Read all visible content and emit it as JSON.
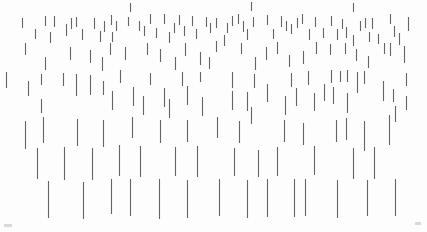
{
  "canvas": {
    "width": 427,
    "height": 232,
    "background": "#fdfdfd"
  },
  "pattern": {
    "stroke_color": "#4a4a4a",
    "stroke_width": 1.1,
    "stroke_opacity": 0.85,
    "faint_mark_color": "#d9d9d9",
    "segments": [
      [
        130,
        3,
        9
      ],
      [
        251,
        2,
        9
      ],
      [
        353,
        3,
        9
      ],
      [
        22,
        18,
        10
      ],
      [
        45,
        16,
        10
      ],
      [
        54,
        16,
        11
      ],
      [
        35,
        29,
        10
      ],
      [
        50,
        32,
        11
      ],
      [
        66,
        24,
        12
      ],
      [
        71,
        18,
        11
      ],
      [
        76,
        17,
        10
      ],
      [
        82,
        29,
        11
      ],
      [
        94,
        18,
        11
      ],
      [
        100,
        31,
        11
      ],
      [
        104,
        21,
        11
      ],
      [
        111,
        15,
        10
      ],
      [
        116,
        21,
        10
      ],
      [
        112,
        32,
        10
      ],
      [
        128,
        17,
        9
      ],
      [
        139,
        21,
        10
      ],
      [
        144,
        26,
        10
      ],
      [
        150,
        14,
        10
      ],
      [
        156,
        28,
        10
      ],
      [
        164,
        14,
        10
      ],
      [
        169,
        32,
        11
      ],
      [
        174,
        23,
        10
      ],
      [
        179,
        15,
        10
      ],
      [
        184,
        26,
        10
      ],
      [
        192,
        16,
        10
      ],
      [
        196,
        29,
        10
      ],
      [
        206,
        17,
        10
      ],
      [
        210,
        23,
        10
      ],
      [
        216,
        18,
        10
      ],
      [
        227,
        23,
        10
      ],
      [
        232,
        16,
        10
      ],
      [
        238,
        14,
        10
      ],
      [
        243,
        21,
        11
      ],
      [
        247,
        29,
        11
      ],
      [
        253,
        17,
        10
      ],
      [
        267,
        15,
        10
      ],
      [
        273,
        29,
        10
      ],
      [
        281,
        16,
        11
      ],
      [
        286,
        21,
        10
      ],
      [
        291,
        24,
        10
      ],
      [
        297,
        18,
        10
      ],
      [
        302,
        14,
        10
      ],
      [
        309,
        29,
        11
      ],
      [
        315,
        17,
        10
      ],
      [
        323,
        28,
        10
      ],
      [
        331,
        16,
        10
      ],
      [
        337,
        29,
        11
      ],
      [
        342,
        19,
        10
      ],
      [
        346,
        27,
        11
      ],
      [
        353,
        35,
        11
      ],
      [
        360,
        21,
        10
      ],
      [
        365,
        18,
        10
      ],
      [
        369,
        32,
        10
      ],
      [
        372,
        18,
        11
      ],
      [
        378,
        34,
        10
      ],
      [
        390,
        14,
        10
      ],
      [
        394,
        26,
        11
      ],
      [
        399,
        33,
        12
      ],
      [
        408,
        17,
        14
      ],
      [
        25,
        43,
        12
      ],
      [
        45,
        57,
        13
      ],
      [
        70,
        47,
        13
      ],
      [
        90,
        50,
        13
      ],
      [
        102,
        57,
        14
      ],
      [
        110,
        43,
        12
      ],
      [
        125,
        47,
        13
      ],
      [
        147,
        43,
        12
      ],
      [
        160,
        49,
        13
      ],
      [
        175,
        57,
        13
      ],
      [
        185,
        43,
        13
      ],
      [
        200,
        52,
        13
      ],
      [
        209,
        57,
        12
      ],
      [
        216,
        41,
        11
      ],
      [
        224,
        35,
        11
      ],
      [
        241,
        43,
        11
      ],
      [
        255,
        57,
        13
      ],
      [
        266,
        47,
        13
      ],
      [
        277,
        42,
        12
      ],
      [
        289,
        55,
        12
      ],
      [
        303,
        51,
        13
      ],
      [
        316,
        42,
        12
      ],
      [
        330,
        44,
        11
      ],
      [
        345,
        43,
        11
      ],
      [
        356,
        49,
        12
      ],
      [
        368,
        56,
        12
      ],
      [
        384,
        43,
        11
      ],
      [
        390,
        43,
        13
      ],
      [
        404,
        46,
        17
      ],
      [
        6,
        72,
        16
      ],
      [
        41,
        74,
        11
      ],
      [
        28,
        81,
        15
      ],
      [
        63,
        73,
        13
      ],
      [
        76,
        74,
        22
      ],
      [
        90,
        75,
        20
      ],
      [
        103,
        81,
        14
      ],
      [
        120,
        70,
        13
      ],
      [
        150,
        73,
        12
      ],
      [
        182,
        72,
        14
      ],
      [
        200,
        72,
        10
      ],
      [
        112,
        91,
        19
      ],
      [
        133,
        87,
        19
      ],
      [
        143,
        96,
        19
      ],
      [
        164,
        88,
        19
      ],
      [
        169,
        99,
        19
      ],
      [
        187,
        86,
        19
      ],
      [
        202,
        97,
        19
      ],
      [
        232,
        72,
        16
      ],
      [
        254,
        74,
        14
      ],
      [
        291,
        73,
        14
      ],
      [
        308,
        71,
        14
      ],
      [
        232,
        91,
        19
      ],
      [
        247,
        92,
        19
      ],
      [
        267,
        84,
        18
      ],
      [
        285,
        96,
        19
      ],
      [
        296,
        88,
        18
      ],
      [
        314,
        93,
        18
      ],
      [
        331,
        70,
        13
      ],
      [
        340,
        71,
        11
      ],
      [
        347,
        70,
        12
      ],
      [
        357,
        72,
        21
      ],
      [
        364,
        71,
        13
      ],
      [
        324,
        84,
        17
      ],
      [
        333,
        87,
        17
      ],
      [
        347,
        93,
        20
      ],
      [
        383,
        81,
        20
      ],
      [
        393,
        89,
        13
      ],
      [
        406,
        73,
        13
      ],
      [
        406,
        96,
        14
      ],
      [
        41,
        99,
        14
      ],
      [
        25,
        121,
        28
      ],
      [
        43,
        117,
        26
      ],
      [
        77,
        119,
        27
      ],
      [
        103,
        120,
        27
      ],
      [
        132,
        117,
        21
      ],
      [
        160,
        120,
        23
      ],
      [
        187,
        120,
        22
      ],
      [
        217,
        117,
        21
      ],
      [
        239,
        121,
        22
      ],
      [
        251,
        107,
        17
      ],
      [
        284,
        120,
        22
      ],
      [
        303,
        123,
        22
      ],
      [
        336,
        120,
        22
      ],
      [
        346,
        118,
        22
      ],
      [
        364,
        121,
        30
      ],
      [
        389,
        115,
        30
      ],
      [
        395,
        106,
        16
      ],
      [
        37,
        148,
        31
      ],
      [
        64,
        147,
        33
      ],
      [
        92,
        148,
        32
      ],
      [
        119,
        145,
        31
      ],
      [
        140,
        146,
        31
      ],
      [
        175,
        147,
        29
      ],
      [
        197,
        146,
        31
      ],
      [
        234,
        148,
        28
      ],
      [
        258,
        150,
        27
      ],
      [
        277,
        147,
        29
      ],
      [
        314,
        146,
        29
      ],
      [
        353,
        148,
        31
      ],
      [
        374,
        147,
        32
      ],
      [
        48,
        181,
        37
      ],
      [
        83,
        182,
        37
      ],
      [
        111,
        179,
        35
      ],
      [
        130,
        179,
        37
      ],
      [
        159,
        179,
        40
      ],
      [
        187,
        180,
        38
      ],
      [
        219,
        179,
        37
      ],
      [
        247,
        180,
        38
      ],
      [
        267,
        179,
        38
      ],
      [
        294,
        179,
        38
      ],
      [
        305,
        179,
        37
      ],
      [
        337,
        180,
        38
      ],
      [
        367,
        180,
        36
      ],
      [
        395,
        179,
        37
      ]
    ],
    "faint_marks": [
      [
        4,
        224,
        8,
        3
      ],
      [
        415,
        222,
        6,
        3
      ]
    ]
  }
}
